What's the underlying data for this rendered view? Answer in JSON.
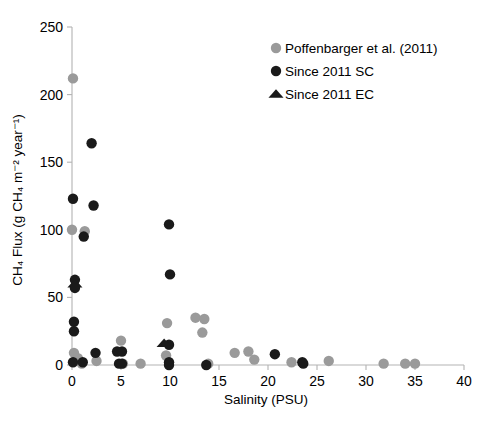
{
  "chart_data": {
    "type": "scatter",
    "title": "",
    "xlabel": "Salinity (PSU)",
    "ylabel": "CH₄ Flux (g CH₄ m⁻² year⁻¹)",
    "xlim": [
      0,
      40
    ],
    "ylim": [
      0,
      250
    ],
    "xticks": [
      0,
      5,
      10,
      15,
      20,
      25,
      30,
      35,
      40
    ],
    "yticks": [
      0,
      50,
      100,
      150,
      200,
      250
    ],
    "xtick_labels": [
      "0",
      "5",
      "10",
      "15",
      "20",
      "25",
      "30",
      "35",
      "40"
    ],
    "ytick_labels": [
      "0",
      "50",
      "100",
      "150",
      "200",
      "250"
    ],
    "grid": false,
    "legend_position": "top-right",
    "series": [
      {
        "name": "Poffenbarger et al. (2011)",
        "marker": "circle",
        "color": "#9a9a9a",
        "points": [
          [
            0.1,
            212
          ],
          [
            0.0,
            100
          ],
          [
            1.3,
            99
          ],
          [
            0.2,
            9
          ],
          [
            0.6,
            5
          ],
          [
            1.0,
            1
          ],
          [
            2.5,
            3
          ],
          [
            5.0,
            18
          ],
          [
            5.2,
            1
          ],
          [
            7.0,
            1
          ],
          [
            9.7,
            31
          ],
          [
            9.6,
            7
          ],
          [
            12.6,
            35
          ],
          [
            13.5,
            34
          ],
          [
            13.3,
            24
          ],
          [
            13.9,
            1
          ],
          [
            16.6,
            9
          ],
          [
            18.0,
            10
          ],
          [
            18.6,
            4
          ],
          [
            22.4,
            2
          ],
          [
            26.2,
            3
          ],
          [
            31.8,
            1
          ],
          [
            34.0,
            1
          ],
          [
            35.0,
            1
          ]
        ]
      },
      {
        "name": "Since 2011 SC",
        "marker": "circle",
        "color": "#1a1a1a",
        "points": [
          [
            2.0,
            164
          ],
          [
            0.1,
            123
          ],
          [
            2.2,
            118
          ],
          [
            1.2,
            95
          ],
          [
            0.3,
            63
          ],
          [
            0.3,
            57
          ],
          [
            0.2,
            32
          ],
          [
            0.2,
            25
          ],
          [
            0.1,
            2
          ],
          [
            1.1,
            2
          ],
          [
            2.4,
            9
          ],
          [
            4.6,
            10
          ],
          [
            5.1,
            10
          ],
          [
            4.8,
            1
          ],
          [
            5.1,
            1
          ],
          [
            9.9,
            104
          ],
          [
            10.0,
            67
          ],
          [
            9.9,
            15
          ],
          [
            9.9,
            2
          ],
          [
            9.9,
            0
          ],
          [
            13.7,
            0
          ],
          [
            20.7,
            8
          ],
          [
            23.5,
            2
          ],
          [
            23.6,
            1
          ]
        ]
      },
      {
        "name": "Since 2011 EC",
        "marker": "triangle",
        "color": "#1a1a1a",
        "points": [
          [
            0.3,
            60
          ],
          [
            9.4,
            16
          ]
        ]
      }
    ]
  },
  "legend": {
    "items": [
      {
        "label": "Poffenbarger et al. (2011)",
        "marker": "circle",
        "color": "#9a9a9a"
      },
      {
        "label": "Since 2011 SC",
        "marker": "circle",
        "color": "#1a1a1a"
      },
      {
        "label": "Since 2011 EC",
        "marker": "triangle",
        "color": "#1a1a1a"
      }
    ]
  },
  "colors": {
    "gray_marker": "#9a9a9a",
    "black_marker": "#1a1a1a",
    "axis": "#b3b3b3",
    "background": "#ffffff"
  }
}
